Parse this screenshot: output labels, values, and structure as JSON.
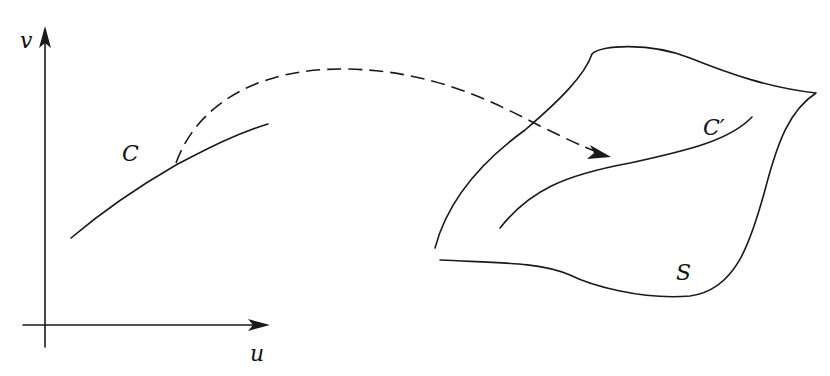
{
  "diagram": {
    "labels": {
      "v_axis": "v",
      "u_axis": "u",
      "curve_plane": "C",
      "curve_surface": "C′",
      "surface": "S"
    },
    "colors": {
      "ink": "#1a1a1a",
      "background": "#ffffff"
    }
  }
}
